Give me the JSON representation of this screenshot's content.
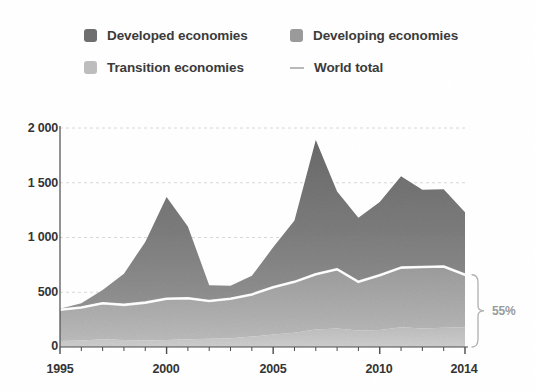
{
  "legend": {
    "items": [
      {
        "label": "Developed economies",
        "icon": "square-swatch-icon",
        "color": "#6e6e6e",
        "type": "area"
      },
      {
        "label": "Developing economies",
        "icon": "square-swatch-icon",
        "color": "#9a9a9a",
        "type": "area"
      },
      {
        "label": "Transition economies",
        "icon": "square-swatch-icon",
        "color": "#bdbdbd",
        "type": "area"
      },
      {
        "label": "World total",
        "icon": "line-swatch-icon",
        "color": "#c2c2c2",
        "type": "line"
      }
    ]
  },
  "annotation": {
    "bracket_label": "55%",
    "bracket_icon": "curly-bracket-icon"
  },
  "chart_data": {
    "type": "area",
    "stacked": true,
    "title": "",
    "subtitle": "",
    "xlabel": "",
    "ylabel": "",
    "xlim": [
      1995,
      2014
    ],
    "ylim": [
      0,
      2000
    ],
    "yticks": [
      0,
      500,
      1000,
      1500,
      2000
    ],
    "ytick_labels": [
      "0",
      "500",
      "1 000",
      "1 500",
      "2 000"
    ],
    "xticks": [
      1995,
      2000,
      2005,
      2010,
      2014
    ],
    "xtick_labels": [
      "1995",
      "2000",
      "2005",
      "2010",
      "2014"
    ],
    "minor_xticks_every": 1,
    "grid": "horizontal-dashed",
    "legend_position": "top",
    "x": [
      1995,
      1996,
      1997,
      1998,
      1999,
      2000,
      2001,
      2002,
      2003,
      2004,
      2005,
      2006,
      2007,
      2008,
      2009,
      2010,
      2011,
      2012,
      2013,
      2014
    ],
    "series": [
      {
        "name": "Transition economies",
        "color": "#bdbdbd",
        "stack_order": 1,
        "values": [
          55,
          60,
          70,
          65,
          60,
          65,
          70,
          75,
          80,
          95,
          115,
          130,
          160,
          170,
          150,
          155,
          180,
          170,
          175,
          180
        ]
      },
      {
        "name": "Developing economies",
        "color": "#9a9a9a",
        "stack_order": 2,
        "values": [
          285,
          300,
          330,
          320,
          345,
          375,
          375,
          345,
          360,
          385,
          430,
          465,
          505,
          540,
          445,
          500,
          545,
          560,
          560,
          480
        ]
      },
      {
        "name": "Developed economies",
        "color": "#6e6e6e",
        "stack_order": 3,
        "values": [
          10,
          40,
          120,
          285,
          555,
          930,
          655,
          145,
          120,
          170,
          365,
          560,
          1225,
          710,
          585,
          670,
          835,
          705,
          705,
          570
        ]
      }
    ],
    "line_series": [
      {
        "name": "World total",
        "color": "#ffffff",
        "description": "boundary line drawn on top of the Transition + Developing stack",
        "values": [
          340,
          360,
          400,
          385,
          405,
          440,
          445,
          420,
          440,
          480,
          545,
          595,
          665,
          710,
          595,
          655,
          725,
          730,
          735,
          660
        ]
      }
    ],
    "totals": [
      350,
      400,
      520,
      670,
      960,
      1370,
      1100,
      565,
      560,
      650,
      910,
      1155,
      1890,
      1420,
      1180,
      1325,
      1560,
      1435,
      1440,
      1230
    ]
  }
}
